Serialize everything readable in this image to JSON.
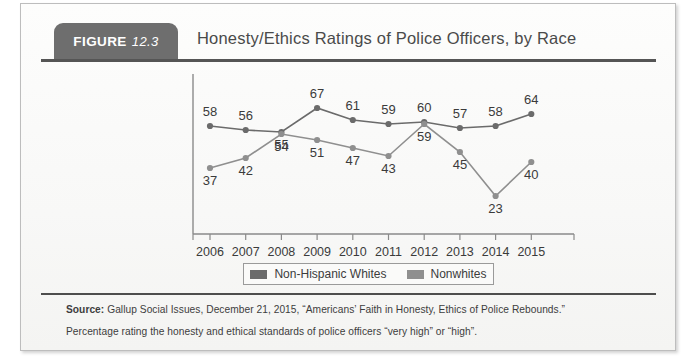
{
  "figure": {
    "badge_word": "FIGURE",
    "badge_number": "12.3",
    "title": "Honesty/Ethics Ratings of Police Officers, by Race"
  },
  "legend": {
    "entries": [
      {
        "label": "Non-Hispanic Whites",
        "color": "#6b6b6b"
      },
      {
        "label": "Nonwhites",
        "color": "#8f8f8f"
      }
    ]
  },
  "notes": {
    "source_label": "Source:",
    "source_text": " Gallup Social Issues, December 21, 2015, “Americans’ Faith in Honesty, Ethics of Police Rebounds.”",
    "percentage_text": "Percentage rating the honesty and ethical standards of police officers “very high” or “high”."
  },
  "chart_data": {
    "type": "line",
    "title": "Honesty/Ethics Ratings of Police Officers, by Race",
    "xlabel": "",
    "ylabel": "",
    "categories": [
      "2006",
      "2007",
      "2008",
      "2009",
      "2010",
      "2011",
      "2012",
      "2013",
      "2014",
      "2015"
    ],
    "series": [
      {
        "name": "Non-Hispanic Whites",
        "color": "#6b6b6b",
        "values": [
          58,
          56,
          55,
          67,
          61,
          59,
          60,
          57,
          58,
          64
        ]
      },
      {
        "name": "Nonwhites",
        "color": "#8f8f8f",
        "values": [
          37,
          42,
          54,
          51,
          47,
          43,
          59,
          45,
          23,
          40
        ]
      }
    ],
    "ylim": [
      15,
      72
    ],
    "grid": false,
    "legend_position": "bottom",
    "data_labels": true
  }
}
